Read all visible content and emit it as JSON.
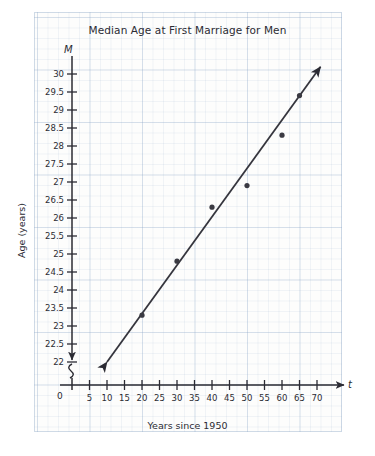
{
  "chart_data": {
    "type": "scatter",
    "title": "Median Age at First Marriage for Men",
    "xlabel": "Years since 1950",
    "ylabel": "Age (years)",
    "x_variable": "t",
    "y_variable": "M",
    "origin_label": "0",
    "grid": true,
    "axis_break_y": true,
    "xlim": [
      0,
      72
    ],
    "ylim": [
      21.75,
      30.25
    ],
    "xticks": [
      5,
      10,
      15,
      20,
      25,
      30,
      35,
      40,
      45,
      50,
      55,
      60,
      65,
      70
    ],
    "xtick_labels": [
      "5",
      "10",
      "15",
      "20",
      "25",
      "30",
      "35",
      "40",
      "45",
      "50",
      "55",
      "60",
      "65",
      "70"
    ],
    "yticks": [
      22,
      22.5,
      23,
      23.5,
      24,
      24.5,
      25,
      25.5,
      26,
      26.5,
      27,
      27.5,
      28,
      28.5,
      29,
      29.5,
      30
    ],
    "ytick_labels": [
      "22",
      "22.5",
      "23",
      "23.5",
      "24",
      "24.5",
      "25",
      "25.5",
      "26",
      "26.5",
      "27",
      "27.5",
      "28",
      "28.5",
      "29",
      "29.5",
      "30"
    ],
    "x": [
      20,
      30,
      40,
      50,
      60,
      65
    ],
    "values": [
      23.3,
      24.8,
      26.3,
      26.9,
      28.3,
      29.4
    ],
    "points": [
      {
        "t": 20,
        "M": 23.3
      },
      {
        "t": 30,
        "M": 24.8
      },
      {
        "t": 40,
        "M": 26.3
      },
      {
        "t": 50,
        "M": 26.9
      },
      {
        "t": 60,
        "M": 28.3
      },
      {
        "t": 65,
        "M": 29.4
      }
    ],
    "trend_line": {
      "start": {
        "t": 10,
        "M": 22.0
      },
      "end": {
        "t": 71,
        "M": 30.2
      },
      "double_arrow": true
    },
    "colors": {
      "ink": "#2b2b33",
      "grid_major": "#96afcd",
      "grid_minor": "#c8d6e6",
      "paper": "#fdfdfc",
      "point": "#3a3a42"
    }
  }
}
